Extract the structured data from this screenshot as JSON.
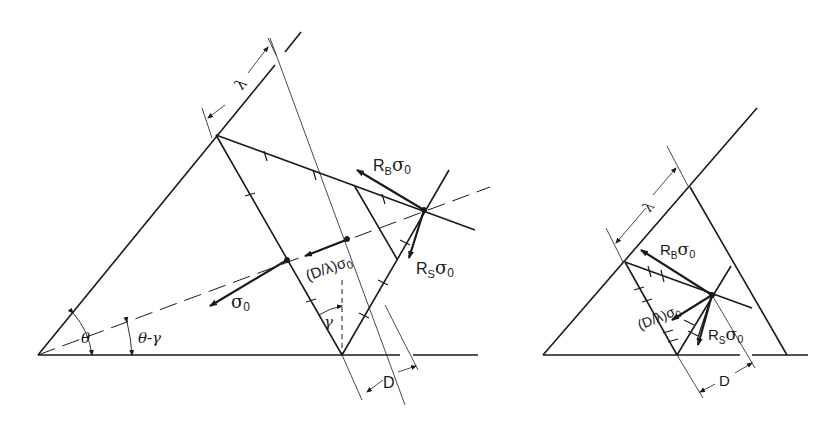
{
  "figure": {
    "left_panel": {
      "labels": {
        "lambda": "λ",
        "rb_base": "R",
        "rb_sub": "B",
        "rb_sigma": "σ",
        "rb_sigma_sub": "0",
        "rs_base": "R",
        "rs_sub": "S",
        "rs_sigma": "σ",
        "rs_sigma_sub": "0",
        "dl_base": "(D/λ)σ",
        "dl_sub": "0",
        "sigma0": "σ",
        "sigma0_sub": "0",
        "theta": "θ",
        "theta_minus_gamma": "θ-γ",
        "gamma": "γ",
        "d": "D"
      }
    },
    "right_panel": {
      "labels": {
        "lambda": "λ",
        "rb_base": "R",
        "rb_sub": "B",
        "rb_sigma": "σ",
        "rb_sigma_sub": "0",
        "dl_base": "(D/λ)σ",
        "dl_sub": "0",
        "rs_base": "R",
        "rs_sub": "S",
        "rs_sigma": "σ",
        "rs_sigma_sub": "0",
        "d": "D"
      }
    },
    "colors": {
      "ink": "#1a1a1a",
      "background": "#ffffff"
    }
  }
}
